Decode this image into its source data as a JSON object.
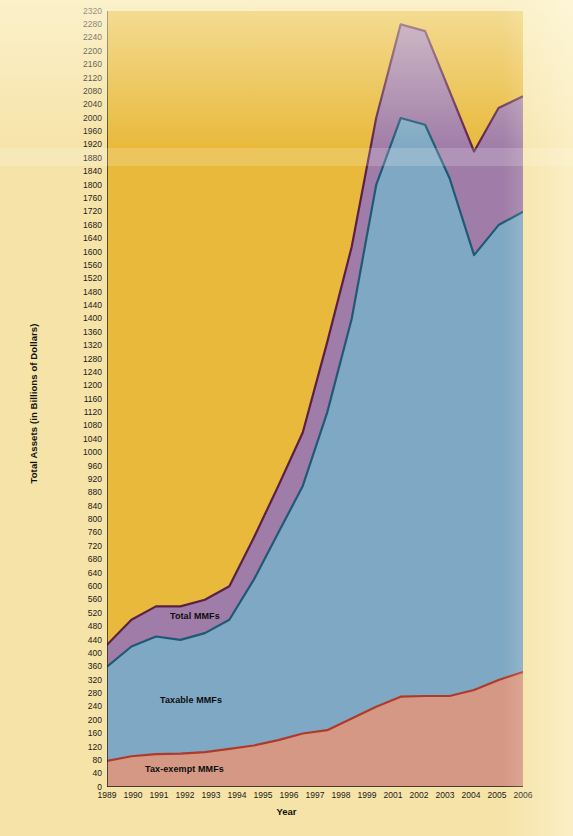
{
  "figure": {
    "xlabel": "Year",
    "ylabel": "Total Assets (in Billions of Dollars)",
    "series_labels": {
      "total": "Total MMFs",
      "taxable": "Taxable MMFs",
      "tax_exempt": "Tax-exempt MMFs"
    },
    "colors": {
      "background": "#E8B93A",
      "page": "#F6E3A8",
      "total_fill": "#A07CA8",
      "total_line": "#5C1F48",
      "taxable_fill": "#7FA8C4",
      "taxable_line": "#1F5A75",
      "tax_exempt_fill": "#D59884",
      "tax_exempt_line": "#B03A2A",
      "axis": "#1a1a1a"
    }
  },
  "chart_data": {
    "type": "area",
    "title": "",
    "xlabel": "Year",
    "ylabel": "Total Assets (in Billions of Dollars)",
    "xlim": [
      1989,
      2006
    ],
    "ylim": [
      0,
      2320
    ],
    "ytick_step": 40,
    "grid": false,
    "legend": "in-plot labels",
    "stacked": true,
    "categories": [
      1989,
      1990,
      1991,
      1992,
      1993,
      1994,
      1995,
      1996,
      1997,
      1998,
      1999,
      2000,
      2001,
      2002,
      2003,
      2004,
      2005,
      2006
    ],
    "xtick_labels": [
      "1989",
      "1990",
      "1991",
      "1992",
      "1993",
      "1994",
      "1995",
      "1996",
      "1997",
      "1998",
      "1999",
      "2001",
      "2002",
      "2003",
      "2004",
      "2005",
      "2006"
    ],
    "ytick_labels": [
      "2320",
      "2280",
      "2240",
      "2200",
      "2160",
      "2120",
      "2080",
      "2040",
      "2000",
      "1960",
      "1920",
      "1880",
      "1840",
      "1800",
      "1760",
      "1720",
      "1680",
      "1640",
      "1600",
      "1560",
      "1520",
      "1480",
      "1440",
      "1400",
      "1360",
      "1320",
      "1280",
      "1240",
      "1200",
      "1160",
      "1120",
      "1080",
      "1040",
      "1000",
      "960",
      "920",
      "880",
      "840",
      "800",
      "760",
      "720",
      "680",
      "640",
      "600",
      "560",
      "520",
      "480",
      "440",
      "400",
      "360",
      "320",
      "280",
      "240",
      "200",
      "160",
      "120",
      "80",
      "40",
      "0"
    ],
    "series": [
      {
        "name": "Tax-exempt MMFs",
        "values": [
          78,
          92,
          98,
          100,
          104,
          114,
          124,
          140,
          160,
          170,
          205,
          240,
          270,
          272,
          272,
          290,
          320,
          344
        ]
      },
      {
        "name": "Taxable MMFs",
        "values": [
          360,
          420,
          450,
          440,
          460,
          500,
          620,
          760,
          900,
          1120,
          1400,
          1800,
          2000,
          1980,
          1820,
          1590,
          1680,
          1720
        ]
      },
      {
        "name": "Total MMFs",
        "values": [
          425,
          500,
          540,
          540,
          560,
          600,
          745,
          900,
          1060,
          1330,
          1615,
          2000,
          2280,
          2260,
          2080,
          1900,
          2030,
          2065
        ]
      }
    ]
  }
}
